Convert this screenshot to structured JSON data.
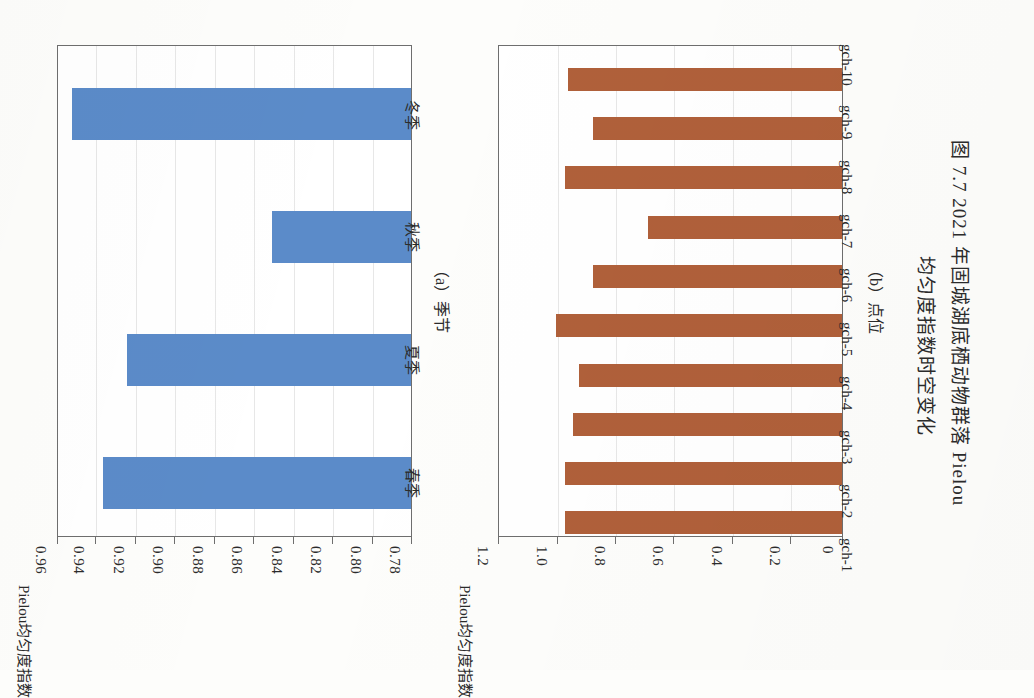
{
  "figure": {
    "caption_line1": "图 7.7  2021 年固城湖底栖动物群落 Pielou",
    "caption_line2": "均匀度指数时空变化"
  },
  "panel_a": {
    "subcaption": "（a）季节",
    "axis_title": "Pielou均匀度指数",
    "category_axis_name": "季节"
  },
  "panel_b": {
    "subcaption": "（b）点位",
    "axis_title": "Pielou均匀度指数",
    "category_axis_name": "点位"
  },
  "colors": {
    "series_a": "#5b8bc9",
    "series_b": "#b0603a",
    "axis": "#6e6e6e",
    "grid": "#e7e7e7",
    "page": "#fdfdfb"
  },
  "chart_data": [
    {
      "id": "panel_a",
      "type": "bar",
      "orientation": "horizontal",
      "title": "（a）季节",
      "xlabel": "季节",
      "ylabel": "Pielou均匀度指数",
      "categories": [
        "春季",
        "夏季",
        "秋季",
        "冬季"
      ],
      "values": [
        0.937,
        0.925,
        0.851,
        0.953
      ],
      "ylim": [
        0.78,
        0.96
      ],
      "yticks": [
        "0.96",
        "0.94",
        "0.92",
        "0.90",
        "0.88",
        "0.86",
        "0.84",
        "0.82",
        "0.80",
        "0.78"
      ],
      "ytick_values": [
        0.96,
        0.94,
        0.92,
        0.9,
        0.88,
        0.86,
        0.84,
        0.82,
        0.8,
        0.78
      ],
      "grid": true,
      "legend": "none",
      "color": "#5b8bc9"
    },
    {
      "id": "panel_b",
      "type": "bar",
      "orientation": "horizontal",
      "title": "（b）点位",
      "xlabel": "点位",
      "ylabel": "Pielou均匀度指数",
      "categories": [
        "gch-1",
        "gch-2",
        "gch-3",
        "gch-4",
        "gch-5",
        "gch-6",
        "gch-7",
        "gch-8",
        "gch-9",
        "gch-10"
      ],
      "values": [
        0.97,
        0.97,
        0.94,
        0.92,
        1.0,
        0.87,
        0.68,
        0.97,
        0.87,
        0.96
      ],
      "ylim": [
        0,
        1.2
      ],
      "yticks": [
        "1.2",
        "1.0",
        "0.8",
        "0.6",
        "0.4",
        "0.2",
        "0"
      ],
      "ytick_values": [
        1.2,
        1.0,
        0.8,
        0.6,
        0.4,
        0.2,
        0
      ],
      "grid": true,
      "legend": "none",
      "color": "#b0603a"
    }
  ]
}
